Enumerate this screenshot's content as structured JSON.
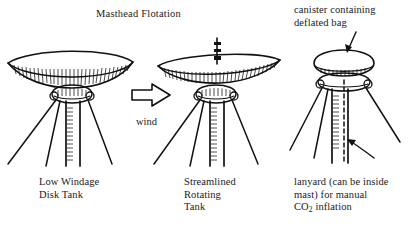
{
  "figure": {
    "title": "Masthead Flotation",
    "background_color": "#ffffff",
    "ink_color": "#111111"
  },
  "panels": [
    {
      "id": "low-windage-disk-tank",
      "caption": "Low Windage\nDisk Tank",
      "description": "wide flat lens-shaped disk tank on masthead with three shrouds"
    },
    {
      "id": "streamlined-rotating-tank",
      "caption": "Streamlined\nRotating\nTank",
      "description": "thin tilted airfoil tank with vertical spindle on masthead"
    },
    {
      "id": "canister-masthead",
      "caption": "lanyard (can be inside\nmast) for manual\nCO2 inflation",
      "caption_line1": "lanyard (can be inside",
      "caption_line2": "mast) for manual",
      "caption_line3_pre": "CO",
      "caption_line3_sub": "2",
      "caption_line3_post": " inflation",
      "description": "rounded canister on masthead collar with lanyard running down mast"
    }
  ],
  "annotations": {
    "wind_label": "wind",
    "canister_label": "canister containing\ndeflated bag",
    "canister_label_line1": "canister containing",
    "canister_label_line2": "deflated bag"
  }
}
